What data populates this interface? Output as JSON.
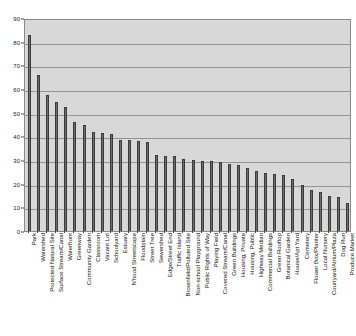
{
  "chart_data": {
    "type": "bar",
    "title": "",
    "subtitle": "",
    "xlabel": "",
    "ylabel": "",
    "ylim": [
      0,
      90
    ],
    "yticks": [
      0,
      10,
      20,
      30,
      40,
      50,
      60,
      70,
      80,
      90
    ],
    "grid": true,
    "legend": "none",
    "orientation": "vertical",
    "bar_color": "#6e6e6e",
    "plot_background": "#d8d8d8",
    "categories": [
      "Park",
      "Watershed",
      "Protected Natural Site",
      "Surface Stream/Canal",
      "Waterfront",
      "Greenway",
      "Community Garden",
      "Classroom",
      "Vacant Lot",
      "Schoolyard",
      "Estuary",
      "N'hood Streetscape",
      "Floodplain",
      "Street Tree",
      "Sewershed",
      "Edge/Street End",
      "Traffic Island",
      "Brownfield/Polluted Site",
      "Non-school Playground",
      "Public Rights of Way",
      "Playing Field",
      "Covered Stream/Canal",
      "Green Buildings",
      "Housing, Private",
      "Housing, Public",
      "Highway Median",
      "Commercial Buildings",
      "Green  Rooftop",
      "Botanical Garden",
      "House/Apt Yard",
      "Cemetery",
      "Flower Box/Planter",
      "Local Nursery",
      "Courtyard/Atrium/Plaza",
      "Dog Run",
      "Produce Market"
    ],
    "values": [
      83,
      66,
      57.5,
      54.5,
      52.5,
      46,
      45,
      42,
      41.5,
      41,
      38.5,
      38.5,
      38,
      37.5,
      32,
      31.5,
      31.5,
      30.5,
      30,
      29.5,
      29.5,
      29,
      28.5,
      28,
      26.5,
      25.5,
      24.5,
      24,
      23.5,
      22,
      19.5,
      17.5,
      16.5,
      15,
      14.5,
      12
    ]
  },
  "axes": {
    "y_tick_labels": [
      "0",
      "10",
      "20",
      "30",
      "40",
      "50",
      "60",
      "70",
      "80",
      "90"
    ]
  }
}
